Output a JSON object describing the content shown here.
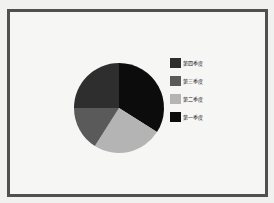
{
  "chart_data": {
    "type": "pie",
    "title": "",
    "categories": [
      "第一季度",
      "第二季度",
      "第三季度",
      "第四季度"
    ],
    "values": [
      34,
      25,
      16,
      25
    ],
    "colors": [
      "#0c0c0c",
      "#b4b4b4",
      "#5a5a5a",
      "#2e2e2e"
    ],
    "start_angle": "12 o'clock",
    "direction": "clockwise",
    "legend": {
      "position": "right",
      "entries": [
        "第四季度",
        "第三季度",
        "第二季度",
        "第一季度"
      ]
    }
  },
  "legend": {
    "items": [
      {
        "label": "第四季度",
        "color": "#2e2e2e"
      },
      {
        "label": "第三季度",
        "color": "#5a5a5a"
      },
      {
        "label": "第二季度",
        "color": "#b4b4b4"
      },
      {
        "label": "第一季度",
        "color": "#0c0c0c"
      }
    ]
  }
}
